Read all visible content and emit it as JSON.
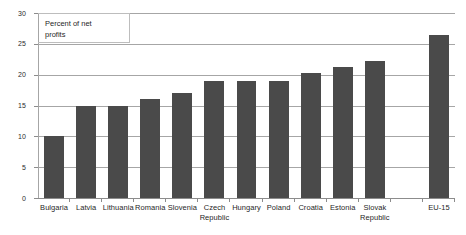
{
  "chart_data": {
    "type": "bar",
    "title": "",
    "annotation": "Percent of net\nprofits",
    "xlabel": "",
    "ylabel": "",
    "ylim": [
      0,
      30
    ],
    "yticks": [
      0,
      5,
      10,
      15,
      20,
      25,
      30
    ],
    "grid": true,
    "legend": "none",
    "bar_color": "#4a4a4a",
    "gridline_color": "#a6a6a6",
    "axis_color": "#8c8c8c",
    "categories": [
      "Bulgaria",
      "Latvia",
      "Lithuania",
      "Romania",
      "Slovenia",
      "Czech\nRepublic",
      "Hungary",
      "Poland",
      "Croatia",
      "Estonia",
      "Slovak\nRepublic",
      "",
      "EU-15"
    ],
    "values": [
      10,
      15,
      15,
      16,
      17,
      19,
      19,
      19,
      20.2,
      21.2,
      22.2,
      null,
      26.4
    ]
  }
}
